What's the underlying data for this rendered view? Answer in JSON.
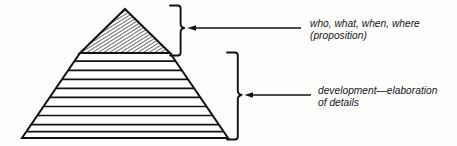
{
  "figure": {
    "type": "pyramid-diagram",
    "background_color": "#fdfdfb",
    "ink_color": "#111111",
    "annotations": [
      {
        "id": "proposition",
        "target_section": "apex",
        "line1": "who, what, when, where",
        "line2": "(proposition)"
      },
      {
        "id": "development",
        "target_section": "base-bands",
        "line1": "development—elaboration",
        "line2": "of details"
      }
    ],
    "pyramid": {
      "apex_x": 125,
      "apex_y": 9,
      "base_left_x": 22,
      "base_right_x": 228,
      "base_y": 138,
      "apex_section": {
        "fill": "diagonal-hatch",
        "hatch_angle_deg": 58,
        "hatch_spacing_px": 2.6,
        "bottom_y": 53
      },
      "band_divider_ys": [
        53,
        62,
        71,
        80,
        89,
        98,
        107,
        116,
        125,
        132
      ],
      "band_count": 10
    },
    "braces": [
      {
        "id": "brace-top",
        "x": 176,
        "top_y": 5,
        "bottom_y": 56,
        "tip_x": 185,
        "tip_y": 28
      },
      {
        "id": "brace-bottom",
        "x": 233,
        "top_y": 52,
        "bottom_y": 140,
        "tip_x": 242,
        "tip_y": 95
      }
    ],
    "arrows": [
      {
        "id": "arrow-top",
        "from_x": 301,
        "to_x": 189,
        "y": 28,
        "direction": "left"
      },
      {
        "id": "arrow-bottom",
        "from_x": 311,
        "to_x": 246,
        "y": 95,
        "direction": "left"
      }
    ]
  }
}
